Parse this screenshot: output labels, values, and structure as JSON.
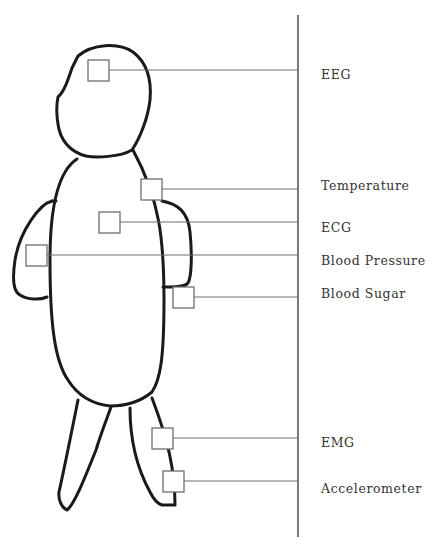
{
  "diagram": {
    "title": "",
    "colors": {
      "outline": "#1a1a1a",
      "sensor": "#6e6e6e",
      "text": "#333333"
    },
    "sensors": [
      {
        "id": "eeg",
        "label": "EEG",
        "location": "head"
      },
      {
        "id": "temperature",
        "label": "Temperature",
        "location": "chest"
      },
      {
        "id": "ecg",
        "label": "ECG",
        "location": "chest"
      },
      {
        "id": "blood_pressure",
        "label": "Blood Pressure",
        "location": "left arm"
      },
      {
        "id": "blood_sugar",
        "label": "Blood Sugar",
        "location": "right arm"
      },
      {
        "id": "emg",
        "label": "EMG",
        "location": "leg"
      },
      {
        "id": "accelerometer",
        "label": "Accelerometer",
        "location": "lower leg"
      }
    ]
  }
}
